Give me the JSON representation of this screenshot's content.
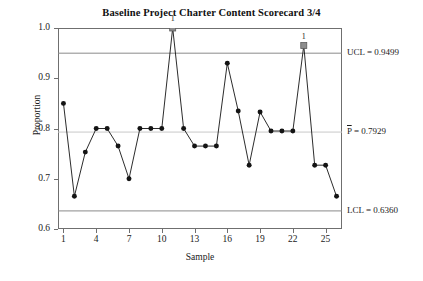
{
  "chart_data": {
    "type": "line",
    "title": "Baseline Project Charter Content Scorecard 3/4",
    "xlabel": "Sample",
    "ylabel": "Proportion",
    "ylim": [
      0.6,
      1.0
    ],
    "xlim": [
      0.5,
      26.5
    ],
    "ytick_labels": [
      "0.6",
      "0.7",
      "0.8",
      "0.9",
      "1.0"
    ],
    "ytick_values": [
      0.6,
      0.7,
      0.8,
      0.9,
      1.0
    ],
    "xtick_labels": [
      "1",
      "4",
      "7",
      "10",
      "13",
      "16",
      "19",
      "22",
      "25"
    ],
    "xtick_values": [
      1,
      4,
      7,
      10,
      13,
      16,
      19,
      22,
      25
    ],
    "grid": false,
    "legend": "none",
    "x": [
      1,
      2,
      3,
      4,
      5,
      6,
      7,
      8,
      9,
      10,
      11,
      12,
      13,
      14,
      15,
      16,
      17,
      18,
      19,
      20,
      21,
      22,
      23,
      24,
      25,
      26
    ],
    "values": [
      0.85,
      0.665,
      0.753,
      0.8,
      0.8,
      0.765,
      0.7,
      0.8,
      0.8,
      0.8,
      1.0,
      0.8,
      0.765,
      0.765,
      0.765,
      0.93,
      0.835,
      0.727,
      0.833,
      0.795,
      0.795,
      0.795,
      0.965,
      0.727,
      0.727,
      0.665
    ],
    "control_lines": [
      {
        "name": "UCL",
        "label": "UCL = 0.9499",
        "value": 0.9499,
        "color": "#8a8a8a"
      },
      {
        "name": "CL",
        "label": "P = 0.7929",
        "label_prefix": "P",
        "label_suffix": " = 0.7929",
        "value": 0.7929,
        "color": "#c9c9c9"
      },
      {
        "name": "LCL",
        "label": "LCL = 0.6360",
        "value": 0.636,
        "color": "#8a8a8a"
      }
    ],
    "out_of_control_points": [
      {
        "sample": 11,
        "value": 1.0,
        "label": "1"
      },
      {
        "sample": 23,
        "value": 0.965,
        "label": "1"
      }
    ],
    "series_color": "#141414",
    "marker": "circle",
    "marker_size": 4
  }
}
